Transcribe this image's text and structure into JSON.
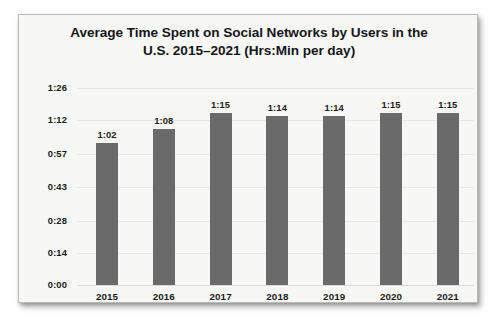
{
  "card": {
    "background_color": "#f7f7f5",
    "border_color": "#b9b9b9"
  },
  "chart_data": {
    "type": "bar",
    "title": "Average Time Spent on Social Networks by Users in the U.S. 2015–2021 (Hrs:Min per day)",
    "title_line1": "Average Time Spent on Social Networks by Users in the",
    "title_line2": "U.S. 2015–2021 (Hrs:Min per day)",
    "xlabel": "",
    "ylabel": "",
    "categories": [
      "2015",
      "2016",
      "2017",
      "2018",
      "2019",
      "2020",
      "2021"
    ],
    "values": [
      62,
      68,
      75,
      74,
      74,
      75,
      75
    ],
    "value_labels": [
      "1:02",
      "1:08",
      "1:15",
      "1:14",
      "1:14",
      "1:15",
      "1:15"
    ],
    "ytick_values": [
      0,
      14,
      28,
      43,
      57,
      72,
      86
    ],
    "ytick_labels": [
      "0:00",
      "0:14",
      "0:28",
      "0:43",
      "0:57",
      "1:12",
      "1:26"
    ],
    "ylim": [
      0,
      86
    ],
    "grid": true,
    "legend": false,
    "bar_color": "#6a6a6a",
    "units": "minutes per day"
  }
}
